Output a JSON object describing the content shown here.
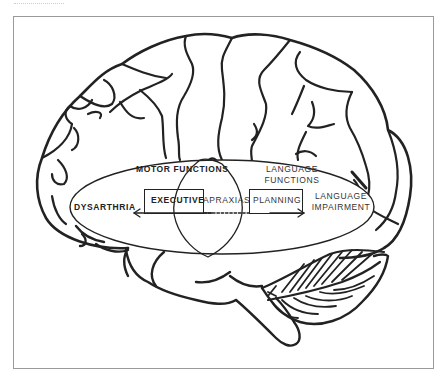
{
  "diagram": {
    "type": "brain-lateral-view-with-functional-overlay",
    "colors": {
      "line": "#222222",
      "frame": "#9a9a9a",
      "background": "#ffffff"
    },
    "regions": {
      "motor": {
        "label": "MOTOR FUNCTIONS"
      },
      "language": {
        "label_line1": "LANGUAGE",
        "label_line2": "FUNCTIONS"
      }
    },
    "boxes": {
      "executive": {
        "label": "EXECUTIVE"
      },
      "planning": {
        "label": "PLANNING"
      }
    },
    "overlap_label": "APRAXIAS",
    "outcomes": {
      "left": {
        "label": "DYSARTHRIA"
      },
      "right": {
        "label_line1": "LANGUAGE",
        "label_line2": "IMPAIRMENT"
      }
    }
  }
}
